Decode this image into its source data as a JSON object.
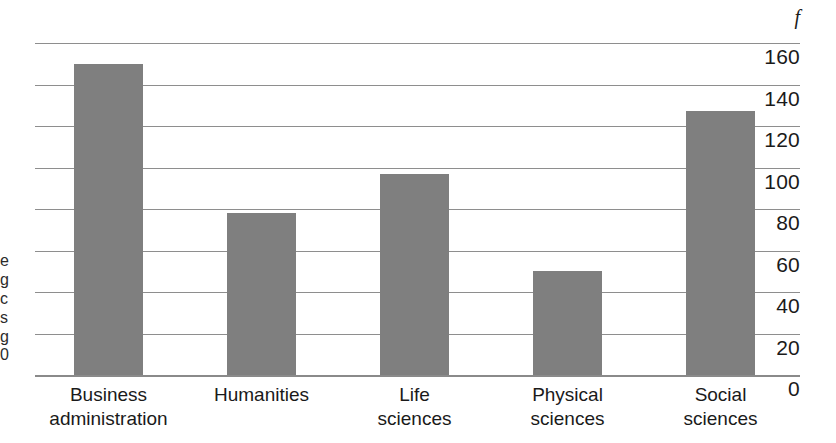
{
  "chart_data": {
    "type": "bar",
    "title": "",
    "subtitle": "",
    "xlabel": "",
    "ylabel": "f",
    "axis_symbol": "f",
    "categories": [
      "Business administration",
      "Humanities",
      "Life sciences",
      "Physical sciences",
      "Social sciences"
    ],
    "category_lines": [
      [
        "Business",
        "administration"
      ],
      [
        "Humanities",
        ""
      ],
      [
        "Life",
        "sciences"
      ],
      [
        "Physical",
        "sciences"
      ],
      [
        "Social",
        "sciences"
      ]
    ],
    "values": [
      150,
      78,
      97,
      50,
      127
    ],
    "ylim": [
      0,
      160
    ],
    "ytick_labels": [
      "160",
      "140",
      "120",
      "100",
      "80",
      "60",
      "40",
      "20",
      "0"
    ],
    "ytick_values": [
      160,
      140,
      120,
      100,
      80,
      60,
      40,
      20,
      0
    ],
    "ytick_step": 20,
    "grid": true,
    "grid_orientation": "horizontal",
    "legend": "none",
    "legend_position": "none",
    "bar_color": "#7f7f7f",
    "gridline_color": "#8e8e8e",
    "text_color": "#1a1a1a",
    "background_color": "#ffffff"
  },
  "margin_fragments": [
    "e",
    "g",
    "c",
    "s",
    "g",
    "0"
  ]
}
